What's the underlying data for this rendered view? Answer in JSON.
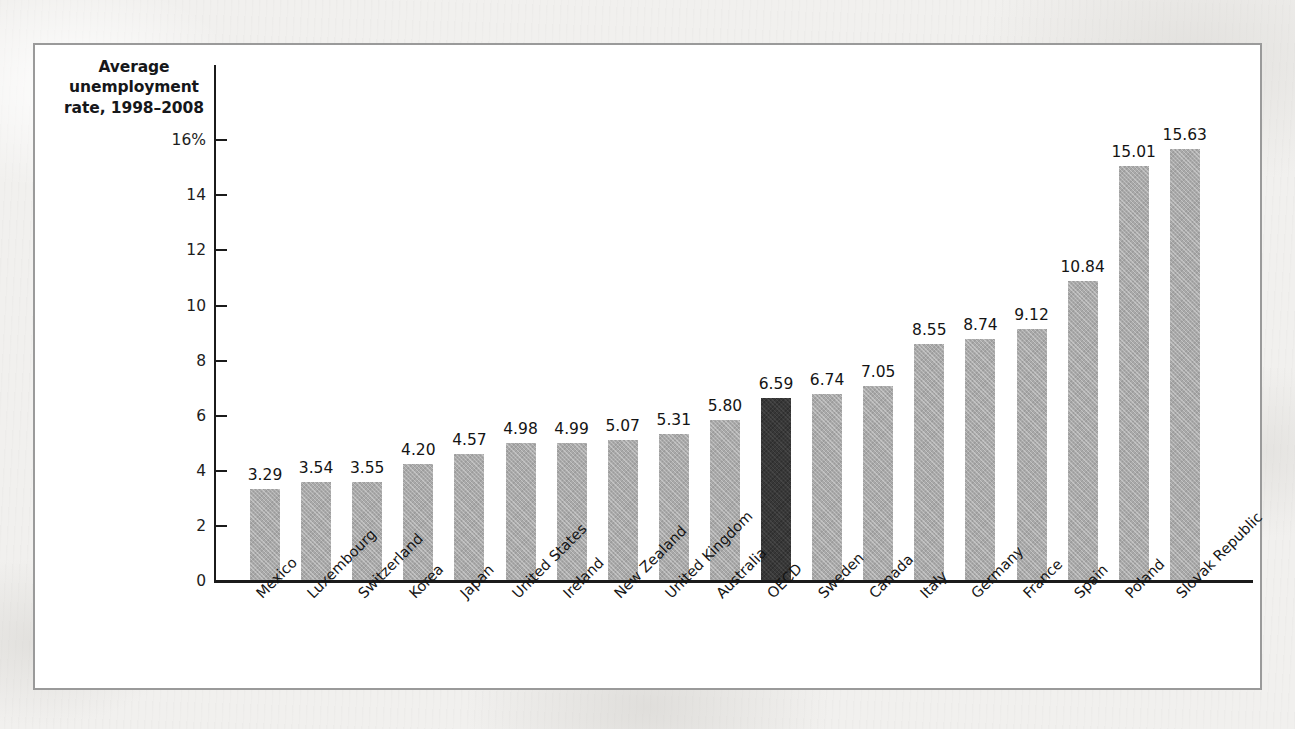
{
  "figure": {
    "axis_title_lines": [
      "Average",
      "unemployment",
      "rate, 1998–2008"
    ],
    "frame_color": "#9a9a9a",
    "bar_color": "#a9a9a9",
    "highlight_bar_color": "#383838",
    "highlight_category": "OECD"
  },
  "chart_data": {
    "type": "bar",
    "title": "Average unemployment rate, 1998–2008",
    "xlabel": "",
    "ylabel": "Average unemployment rate, 1998–2008",
    "ylim": [
      0,
      16
    ],
    "ytick_labels": [
      "0",
      "2",
      "4",
      "6",
      "8",
      "10",
      "12",
      "14",
      "16%"
    ],
    "ytick_values": [
      0,
      2,
      4,
      6,
      8,
      10,
      12,
      14,
      16
    ],
    "grid": false,
    "legend": false,
    "highlight_index": 10,
    "categories": [
      "Mexico",
      "Luxembourg",
      "Switzerland",
      "Korea",
      "Japan",
      "United States",
      "Ireland",
      "New Zealand",
      "United Kingdom",
      "Australia",
      "OECD",
      "Sweden",
      "Canada",
      "Italy",
      "Germany",
      "France",
      "Spain",
      "Poland",
      "Slovak Republic"
    ],
    "values": [
      3.29,
      3.54,
      3.55,
      4.2,
      4.57,
      4.98,
      4.99,
      5.07,
      5.31,
      5.8,
      6.59,
      6.74,
      7.05,
      8.55,
      8.74,
      9.12,
      10.84,
      15.01,
      15.63
    ],
    "value_labels": [
      "3.29",
      "3.54",
      "3.55",
      "4.20",
      "4.57",
      "4.98",
      "4.99",
      "5.07",
      "5.31",
      "5.80",
      "6.59",
      "6.74",
      "7.05",
      "8.55",
      "8.74",
      "9.12",
      "10.84",
      "15.01",
      "15.63"
    ]
  }
}
